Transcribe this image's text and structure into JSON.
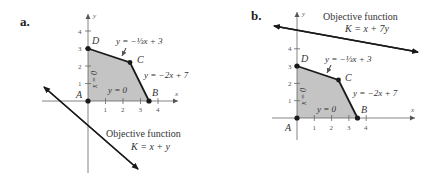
{
  "panels": [
    {
      "tag": "a.",
      "axis_x_label": "x",
      "axis_y_label": "y",
      "x_ticks": [
        "1",
        "2",
        "3",
        "4"
      ],
      "y_ticks": [
        "1",
        "2",
        "3",
        "4"
      ],
      "vertices": {
        "A": "A",
        "B": "B",
        "C": "C",
        "D": "D"
      },
      "constraints": {
        "top": "y = −⅓x + 3",
        "right": "y = −2x + 7",
        "bottom": "y = 0",
        "left": "x = 0"
      },
      "objective_title": "Objective function",
      "objective_eq": "K = x + y"
    },
    {
      "tag": "b.",
      "axis_x_label": "x",
      "axis_y_label": "y",
      "x_ticks": [
        "1",
        "2",
        "3",
        "4"
      ],
      "y_ticks": [
        "1",
        "2",
        "3",
        "4"
      ],
      "vertices": {
        "A": "A",
        "B": "B",
        "C": "C",
        "D": "D"
      },
      "constraints": {
        "top": "y = −⅓x + 3",
        "right": "y = −2x + 7",
        "bottom": "y = 0",
        "left": "x = 0"
      },
      "objective_title": "Objective function",
      "objective_eq": "K = x + 7y"
    }
  ],
  "colors": {
    "region_fill": "#c4c4c4",
    "line": "#1a1a1a",
    "axis": "#555555",
    "text": "#333333"
  }
}
